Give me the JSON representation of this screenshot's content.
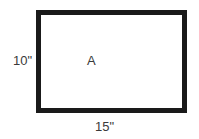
{
  "diagram": {
    "shape": "rectangle",
    "area_label": "A",
    "height_label": "10\"",
    "width_label": "15\"",
    "colors": {
      "border": "#1a1a1a",
      "fill": "#ffffff",
      "text": "#3a3a3a"
    }
  }
}
